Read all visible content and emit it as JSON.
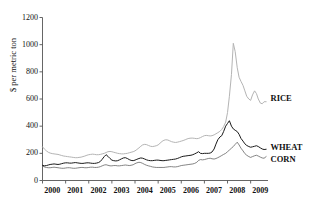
{
  "figure": {
    "clipped_title_fragment": "",
    "background": "#ffffff"
  },
  "axes": {
    "ylabel": "$ per metric ton",
    "ytick_labels": [
      "1200",
      "1000",
      "800",
      "600",
      "400",
      "200",
      "0"
    ],
    "xtick_labels": [
      "2000",
      "2001",
      "2002",
      "2003",
      "2004",
      "2005",
      "2006",
      "2007",
      "2008",
      "2009"
    ],
    "axis_color": "#555555"
  },
  "series_labels": {
    "rice": "RICE",
    "wheat": "WHEAT",
    "corn": "CORN"
  },
  "colors": {
    "rice": "#b4b4b4",
    "wheat": "#1a1a1a",
    "corn": "#6e6e6e",
    "axis": "#555555",
    "text": "#111111"
  },
  "chart_data": {
    "type": "line",
    "title": "",
    "xlabel": "",
    "ylabel": "$ per metric ton",
    "xlim": [
      2000,
      2009.75
    ],
    "ylim": [
      0,
      1200
    ],
    "ytick_values": [
      0,
      200,
      400,
      600,
      800,
      1000,
      1200
    ],
    "xtick_values": [
      2000,
      2001,
      2002,
      2003,
      2004,
      2005,
      2006,
      2007,
      2008,
      2009
    ],
    "grid": false,
    "legend_position": "right-inline-labels",
    "x": [
      2000.0,
      2000.08,
      2000.17,
      2000.25,
      2000.33,
      2000.42,
      2000.5,
      2000.58,
      2000.67,
      2000.75,
      2000.83,
      2000.92,
      2001.0,
      2001.08,
      2001.17,
      2001.25,
      2001.33,
      2001.42,
      2001.5,
      2001.58,
      2001.67,
      2001.75,
      2001.83,
      2001.92,
      2002.0,
      2002.08,
      2002.17,
      2002.25,
      2002.33,
      2002.42,
      2002.5,
      2002.58,
      2002.67,
      2002.75,
      2002.83,
      2002.92,
      2003.0,
      2003.08,
      2003.17,
      2003.25,
      2003.33,
      2003.42,
      2003.5,
      2003.58,
      2003.67,
      2003.75,
      2003.83,
      2003.92,
      2004.0,
      2004.08,
      2004.17,
      2004.25,
      2004.33,
      2004.42,
      2004.5,
      2004.58,
      2004.67,
      2004.75,
      2004.83,
      2004.92,
      2005.0,
      2005.08,
      2005.17,
      2005.25,
      2005.33,
      2005.42,
      2005.5,
      2005.58,
      2005.67,
      2005.75,
      2005.83,
      2005.92,
      2006.0,
      2006.08,
      2006.17,
      2006.25,
      2006.33,
      2006.42,
      2006.5,
      2006.58,
      2006.67,
      2006.75,
      2006.83,
      2006.92,
      2007.0,
      2007.08,
      2007.17,
      2007.25,
      2007.33,
      2007.42,
      2007.5,
      2007.58,
      2007.67,
      2007.75,
      2007.83,
      2007.92,
      2008.0,
      2008.08,
      2008.17,
      2008.25,
      2008.33,
      2008.42,
      2008.5,
      2008.58,
      2008.67,
      2008.75,
      2008.83,
      2008.92,
      2009.0,
      2009.08,
      2009.17,
      2009.25,
      2009.33,
      2009.42,
      2009.5,
      2009.58,
      2009.67
    ],
    "series": [
      {
        "name": "RICE",
        "color": "#b4b4b4",
        "values": [
          248,
          232,
          218,
          208,
          202,
          198,
          196,
          194,
          192,
          188,
          184,
          180,
          178,
          176,
          174,
          172,
          170,
          168,
          168,
          170,
          172,
          176,
          180,
          186,
          190,
          192,
          194,
          192,
          190,
          190,
          192,
          196,
          200,
          206,
          212,
          214,
          212,
          208,
          204,
          200,
          198,
          196,
          196,
          198,
          200,
          204,
          208,
          212,
          218,
          228,
          240,
          252,
          262,
          266,
          264,
          258,
          252,
          250,
          252,
          256,
          262,
          274,
          288,
          296,
          300,
          298,
          292,
          286,
          282,
          280,
          282,
          286,
          290,
          294,
          300,
          306,
          310,
          312,
          312,
          310,
          308,
          310,
          316,
          324,
          330,
          332,
          330,
          328,
          330,
          336,
          344,
          352,
          362,
          376,
          396,
          430,
          500,
          620,
          780,
          1010,
          950,
          830,
          760,
          730,
          700,
          660,
          620,
          600,
          590,
          630,
          660,
          640,
          600,
          570,
          565,
          580,
          580
        ]
      },
      {
        "name": "WHEAT",
        "color": "#1a1a1a",
        "values": [
          112,
          108,
          110,
          114,
          118,
          120,
          122,
          120,
          118,
          120,
          124,
          128,
          130,
          130,
          128,
          128,
          130,
          132,
          130,
          128,
          126,
          126,
          128,
          130,
          130,
          128,
          126,
          126,
          128,
          132,
          140,
          156,
          176,
          190,
          178,
          162,
          150,
          146,
          144,
          146,
          152,
          160,
          166,
          168,
          162,
          154,
          148,
          146,
          150,
          156,
          162,
          166,
          164,
          158,
          152,
          148,
          146,
          146,
          148,
          150,
          150,
          148,
          146,
          146,
          148,
          150,
          152,
          154,
          156,
          158,
          162,
          168,
          174,
          178,
          180,
          182,
          184,
          186,
          190,
          196,
          204,
          212,
          200,
          198,
          200,
          200,
          200,
          202,
          210,
          232,
          268,
          300,
          320,
          330,
          360,
          400,
          420,
          440,
          400,
          380,
          370,
          360,
          340,
          310,
          290,
          270,
          258,
          250,
          245,
          248,
          252,
          256,
          250,
          240,
          232,
          228,
          230
        ]
      },
      {
        "name": "CORN",
        "color": "#6e6e6e",
        "values": [
          106,
          100,
          96,
          94,
          94,
          96,
          98,
          96,
          94,
          92,
          90,
          90,
          92,
          94,
          94,
          92,
          90,
          90,
          92,
          94,
          96,
          96,
          94,
          94,
          96,
          98,
          98,
          96,
          96,
          98,
          102,
          108,
          114,
          116,
          112,
          108,
          108,
          110,
          110,
          108,
          108,
          110,
          112,
          114,
          112,
          110,
          112,
          116,
          124,
          130,
          134,
          132,
          126,
          118,
          112,
          108,
          104,
          100,
          98,
          96,
          96,
          96,
          96,
          96,
          98,
          100,
          102,
          102,
          100,
          100,
          102,
          106,
          110,
          112,
          114,
          116,
          118,
          120,
          122,
          126,
          134,
          148,
          154,
          152,
          154,
          158,
          162,
          164,
          160,
          158,
          162,
          168,
          176,
          184,
          192,
          200,
          212,
          224,
          238,
          250,
          266,
          282,
          262,
          238,
          218,
          198,
          186,
          176,
          170,
          176,
          182,
          186,
          180,
          172,
          166,
          164,
          176
        ]
      }
    ]
  }
}
